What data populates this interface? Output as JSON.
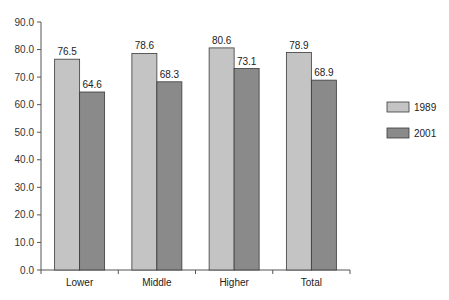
{
  "chart_data": {
    "type": "bar",
    "title": "",
    "xlabel": "",
    "ylabel": "",
    "categories": [
      "Lower",
      "Middle",
      "Higher",
      "Total"
    ],
    "series": [
      {
        "name": "1989",
        "values": [
          76.5,
          78.6,
          80.6,
          78.9
        ],
        "color": "#c4c4c4"
      },
      {
        "name": "2001",
        "values": [
          64.6,
          68.3,
          73.1,
          68.9
        ],
        "color": "#8a8a8a"
      }
    ],
    "ylim": [
      0,
      90
    ],
    "yticks": [
      "0.0",
      "10.0",
      "20.0",
      "30.0",
      "40.0",
      "50.0",
      "60.0",
      "70.0",
      "80.0",
      "90.0"
    ],
    "data_labels": true,
    "grid": false,
    "legend": {
      "position": "right",
      "entries": [
        "1989",
        "2001"
      ]
    }
  }
}
